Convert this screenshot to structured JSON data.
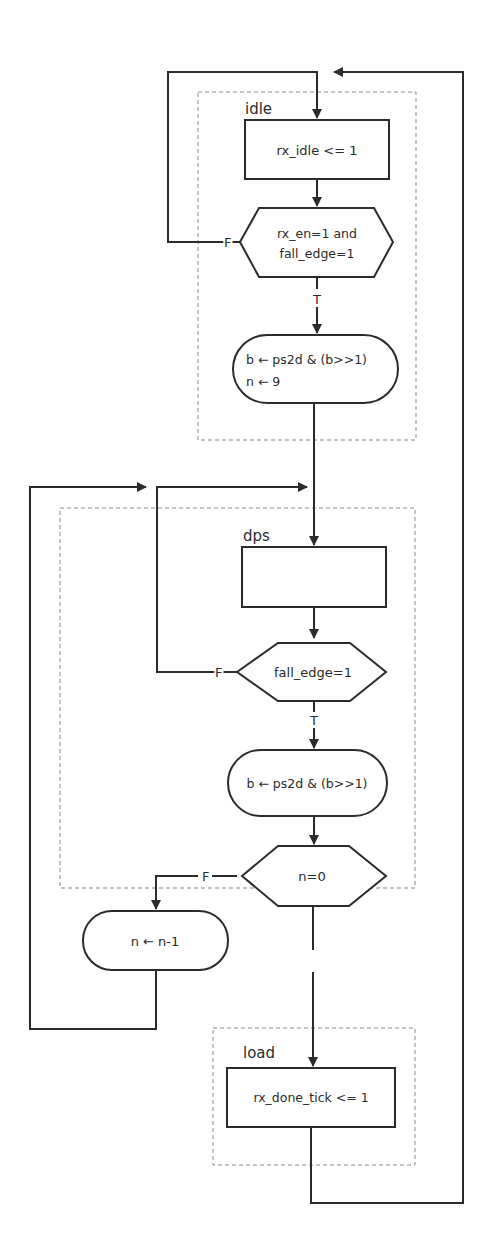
{
  "diagram": {
    "type": "ASM flowchart",
    "colors": {
      "line": "#2b2b2b",
      "dashed": "#8a8a8a",
      "background": "#ffffff"
    },
    "states": [
      {
        "name": "idle",
        "label": "idle"
      },
      {
        "name": "dps",
        "label": "dps"
      },
      {
        "name": "load",
        "label": "load"
      }
    ],
    "blocks": {
      "idle_action": "rx_idle <= 1",
      "idle_decision_line1": "rx_en=1 and",
      "idle_decision_line2": "fall_edge=1",
      "idle_true_label": "T",
      "idle_false_label": "F",
      "idle_cond_action_line1": "b ← ps2d & (b>>1)",
      "idle_cond_action_line2": "n ← 9",
      "dps_action": "",
      "dps_decision": "fall_edge=1",
      "dps_true_label": "T",
      "dps_false_label": "F",
      "dps_cond_action": "b ← ps2d & (b>>1)",
      "n_decision": "n=0",
      "n_false_label": "F",
      "n_dec_action": "n ← n-1",
      "load_action": "rx_done_tick <= 1"
    }
  }
}
